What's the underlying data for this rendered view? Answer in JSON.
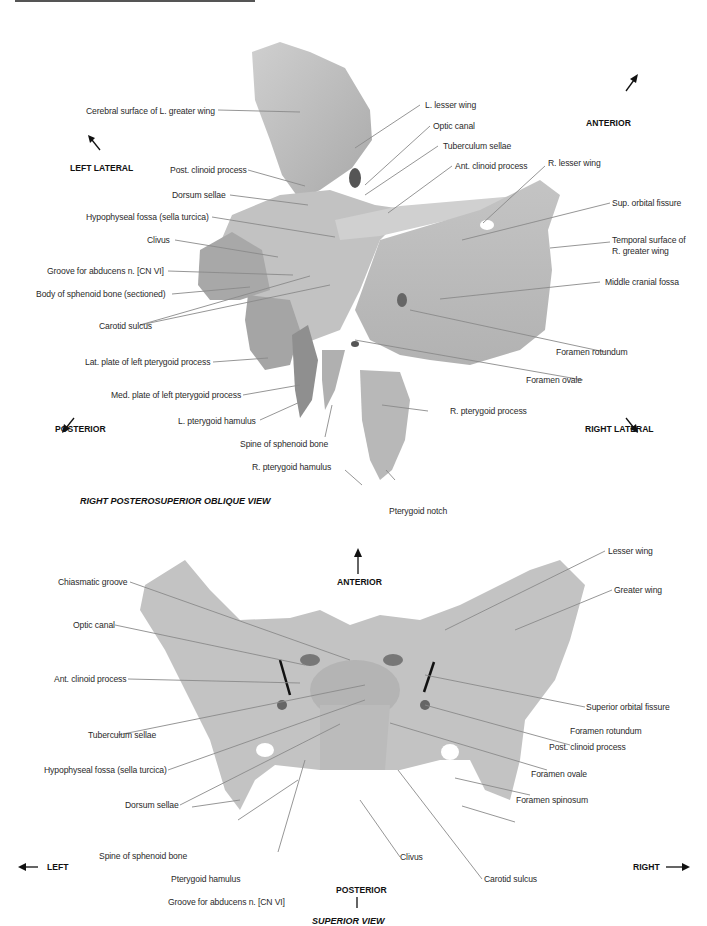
{
  "figure": {
    "top_view": {
      "title": "RIGHT POSTEROSUPERIOR OBLIQUE VIEW",
      "directions": {
        "anterior": "ANTERIOR",
        "left_lateral": "LEFT LATERAL",
        "posterior": "POSTERIOR",
        "right_lateral": "RIGHT LATERAL"
      },
      "labels_left": [
        "Cerebral surface of L. greater wing",
        "Post. clinoid process",
        "Dorsum sellae",
        "Hypophyseal fossa (sella turcica)",
        "Clivus",
        "Groove for abducens n. [CN VI]",
        "Body of sphenoid bone (sectioned)",
        "Carotid sulcus",
        "Lat. plate of left pterygoid process",
        "Med. plate of left pterygoid process",
        "L. pterygoid hamulus",
        "Spine of sphenoid bone",
        "R. pterygoid hamulus"
      ],
      "labels_right": [
        "L. lesser wing",
        "Optic canal",
        "Tuberculum sellae",
        "Ant. clinoid process",
        "R. lesser wing",
        "Sup. orbital fissure",
        "Temporal surface of",
        "R. greater wing",
        "Middle cranial fossa",
        "Foramen rotundum",
        "Foramen ovale",
        "R. pterygoid process",
        "Pterygoid notch"
      ]
    },
    "bottom_view": {
      "title": "SUPERIOR VIEW",
      "directions": {
        "anterior": "ANTERIOR",
        "posterior": "POSTERIOR",
        "left": "LEFT",
        "right": "RIGHT"
      },
      "labels_left": [
        "Chiasmatic groove",
        "Optic canal",
        "Ant. clinoid process",
        "Tuberculum sellae",
        "Hypophyseal fossa (sella turcica)",
        "Dorsum sellae",
        "Spine of sphenoid bone",
        "Pterygoid hamulus",
        "Groove for abducens n. [CN VI]"
      ],
      "labels_right": [
        "Lesser wing",
        "Greater wing",
        "Superior orbital fissure",
        "Foramen rotundum",
        "Post. clinoid process",
        "Foramen ovale",
        "Foramen spinosum",
        "Clivus",
        "Carotid sulcus"
      ]
    },
    "colors": {
      "bone": "#bdbdbd",
      "bone_shadow": "#9a9a9a",
      "leader": "#8a8a8a",
      "text": "#2a2a2a"
    }
  }
}
